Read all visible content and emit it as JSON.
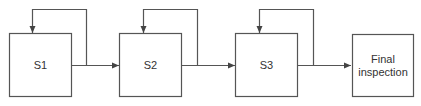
{
  "diagram": {
    "type": "process-flow-with-rework-loops",
    "stroke_color": "#555555",
    "text_color": "#333333",
    "nodes": [
      {
        "id": "s1",
        "label": "S1"
      },
      {
        "id": "s2",
        "label": "S2"
      },
      {
        "id": "s3",
        "label": "S3"
      },
      {
        "id": "final",
        "label_line1": "Final",
        "label_line2": "inspection"
      }
    ],
    "edges": [
      {
        "from": "s1",
        "to": "s2"
      },
      {
        "from": "s2",
        "to": "s3"
      },
      {
        "from": "s3",
        "to": "final"
      },
      {
        "from": "s1",
        "to": "s1",
        "kind": "feedback"
      },
      {
        "from": "s2",
        "to": "s2",
        "kind": "feedback"
      },
      {
        "from": "s3",
        "to": "s3",
        "kind": "feedback"
      }
    ]
  }
}
